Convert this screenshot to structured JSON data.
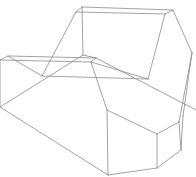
{
  "figure": {
    "type": "wireframe-polyhedron",
    "stroke_color": "#8c8c8c",
    "background": "#ffffff",
    "vertices": {
      "A": [
        82,
        7
      ],
      "B": [
        76,
        12
      ],
      "C": [
        173,
        10
      ],
      "D": [
        165,
        14
      ],
      "E": [
        192,
        53
      ],
      "F": [
        83,
        55
      ],
      "G": [
        42,
        76
      ],
      "H": [
        148,
        79
      ],
      "I": [
        8,
        56
      ],
      "J": [
        0,
        60
      ],
      "K": [
        96,
        58
      ],
      "L": [
        91,
        62
      ],
      "M": [
        0,
        107
      ],
      "N": [
        107,
        110
      ],
      "O": [
        108,
        175
      ],
      "P": [
        157,
        134
      ],
      "Q": [
        157,
        168
      ],
      "R": [
        179,
        122
      ],
      "S": [
        181,
        150
      ],
      "T": [
        183,
        116
      ],
      "U": [
        196,
        110
      ]
    },
    "edges": [
      [
        "A",
        "C"
      ],
      [
        "B",
        "D"
      ],
      [
        "A",
        "B"
      ],
      [
        "C",
        "D"
      ],
      [
        "A",
        "F"
      ],
      [
        "C",
        "E"
      ],
      [
        "B",
        "G"
      ],
      [
        "D",
        "H"
      ],
      [
        "G",
        "H"
      ],
      [
        "I",
        "K"
      ],
      [
        "J",
        "L"
      ],
      [
        "I",
        "J"
      ],
      [
        "K",
        "L"
      ],
      [
        "I",
        "G"
      ],
      [
        "F",
        "K"
      ],
      [
        "F",
        "M"
      ],
      [
        "K",
        "U"
      ],
      [
        "L",
        "H"
      ],
      [
        "L",
        "N"
      ],
      [
        "J",
        "M"
      ],
      [
        "M",
        "O"
      ],
      [
        "N",
        "O"
      ],
      [
        "N",
        "P"
      ],
      [
        "P",
        "Q"
      ],
      [
        "O",
        "Q"
      ],
      [
        "P",
        "R"
      ],
      [
        "R",
        "S"
      ],
      [
        "Q",
        "S"
      ],
      [
        "E",
        "T"
      ],
      [
        "T",
        "S"
      ],
      [
        "E",
        "R"
      ]
    ]
  }
}
